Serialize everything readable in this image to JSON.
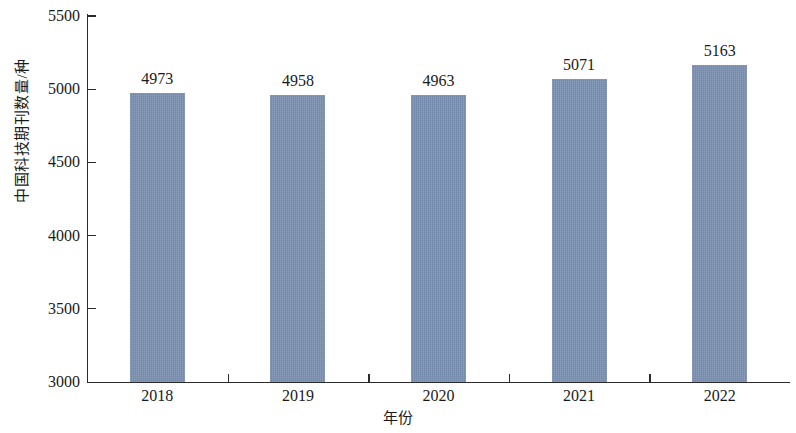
{
  "chart_data": {
    "type": "bar",
    "title": "",
    "categories": [
      "2018",
      "2019",
      "2020",
      "2021",
      "2022"
    ],
    "values": [
      4973,
      4958,
      4963,
      5071,
      5163
    ],
    "series": [
      {
        "name": "中国科技期刊数量",
        "values": [
          4973,
          4958,
          4963,
          5071,
          5163
        ]
      }
    ],
    "xlabel": "年份",
    "ylabel": "中国科技期刊数量/种",
    "ylim": [
      3000,
      5500
    ],
    "ytick_labels": [
      "3000",
      "3500",
      "4000",
      "4500",
      "5000",
      "5500"
    ],
    "ytick_values": [
      3000,
      3500,
      4000,
      4500,
      5000,
      5500
    ],
    "xtick_labels": [
      "2018",
      "2019",
      "2020",
      "2021",
      "2022"
    ],
    "data_labels": [
      "4973",
      "4958",
      "4963",
      "5071",
      "5163"
    ],
    "grid": false,
    "legend": false,
    "legend_position": "none",
    "bar_color": "#7389ab",
    "axis_color": "#2b2b2b",
    "text_color": "#1a1a1a",
    "background_color": "#ffffff"
  }
}
